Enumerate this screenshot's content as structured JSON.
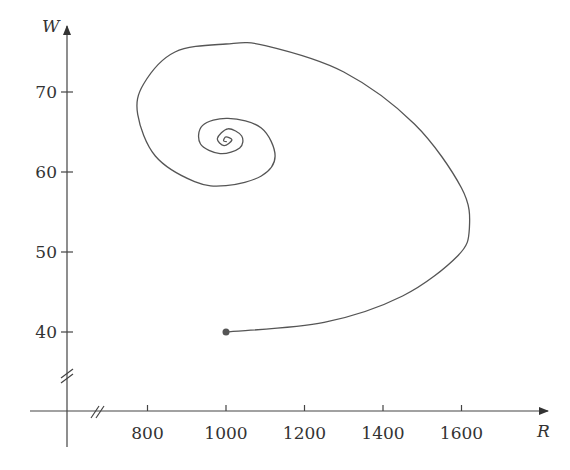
{
  "chart_data": {
    "type": "line",
    "title": "",
    "xlabel": "R",
    "ylabel": "W",
    "xlim": [
      600,
      1800
    ],
    "ylim": [
      30,
      78
    ],
    "x_ticks": [
      800,
      1000,
      1200,
      1400,
      1600
    ],
    "y_ticks": [
      40,
      50,
      60,
      70
    ],
    "x_tick_labels": [
      "800",
      "1000",
      "1200",
      "1400",
      "1600"
    ],
    "y_tick_labels": [
      "40",
      "50",
      "60",
      "70"
    ],
    "axis_breaks": {
      "x": true,
      "y": true
    },
    "grid": false,
    "legend": null,
    "series": [
      {
        "name": "phase trajectory",
        "start_point": {
          "R": 1000,
          "W": 40
        },
        "equilibrium": {
          "R": 1000,
          "W": 64
        },
        "points": [
          {
            "R": 1000,
            "W": 40
          },
          {
            "R": 1250,
            "W": 41.2
          },
          {
            "R": 1450,
            "W": 44.5
          },
          {
            "R": 1590,
            "W": 49.5
          },
          {
            "R": 1620,
            "W": 53
          },
          {
            "R": 1600,
            "W": 58
          },
          {
            "R": 1480,
            "W": 66
          },
          {
            "R": 1300,
            "W": 72.5
          },
          {
            "R": 1100,
            "W": 75.8
          },
          {
            "R": 1000,
            "W": 76
          },
          {
            "R": 870,
            "W": 75
          },
          {
            "R": 790,
            "W": 71
          },
          {
            "R": 775,
            "W": 67.2
          },
          {
            "R": 820,
            "W": 62
          },
          {
            "R": 920,
            "W": 58.8
          },
          {
            "R": 1000,
            "W": 58.3
          },
          {
            "R": 1090,
            "W": 59.5
          },
          {
            "R": 1125,
            "W": 62
          },
          {
            "R": 1090,
            "W": 65.5
          },
          {
            "R": 1005,
            "W": 66.7
          },
          {
            "R": 940,
            "W": 65.8
          },
          {
            "R": 935,
            "W": 63.5
          },
          {
            "R": 985,
            "W": 62.3
          },
          {
            "R": 1035,
            "W": 63
          },
          {
            "R": 1040,
            "W": 64.5
          },
          {
            "R": 1005,
            "W": 65.4
          },
          {
            "R": 978,
            "W": 64.2
          },
          {
            "R": 995,
            "W": 63.3
          },
          {
            "R": 1015,
            "W": 64
          },
          {
            "R": 1000,
            "W": 64.4
          },
          {
            "R": 994,
            "W": 63.9
          },
          {
            "R": 1002,
            "W": 63.8
          }
        ]
      }
    ]
  },
  "axes": {
    "x_name": "R",
    "y_name": "W"
  },
  "colors": {
    "axis": "#444444",
    "curve": "#555555",
    "marker": "#555555"
  }
}
